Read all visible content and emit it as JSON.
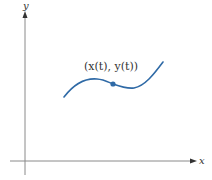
{
  "diagram": {
    "type": "parametric-curve",
    "axes": {
      "x_label": "x",
      "y_label": "y",
      "color": "#7a7a7a"
    },
    "curve": {
      "color": "#2f6aa6",
      "description": "Smooth parametric curve rising, peaking, dipping and rising again"
    },
    "point": {
      "label": "(x(t), y(t))",
      "color": "#2f6aa6"
    }
  }
}
